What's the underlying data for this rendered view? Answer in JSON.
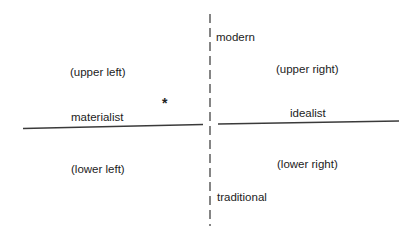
{
  "diagram": {
    "axes": {
      "vertical": {
        "top_label": "modern",
        "bottom_label": "traditional",
        "style": "dashed"
      },
      "horizontal": {
        "left_label": "materialist",
        "right_label": "idealist",
        "style": "solid"
      }
    },
    "quadrants": {
      "upper_left": "(upper left)",
      "upper_right": "(upper right)",
      "lower_left": "(lower left)",
      "lower_right": "(lower right)"
    },
    "marker": {
      "symbol": "*",
      "quadrant": "upper left"
    },
    "colors": {
      "line": "#444444",
      "text": "#1c1c1c",
      "background": "#ffffff"
    }
  }
}
